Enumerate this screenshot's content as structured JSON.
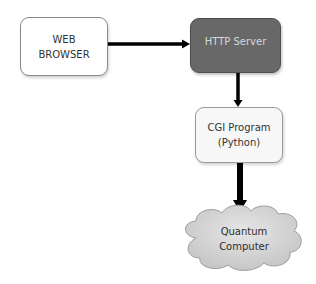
{
  "diagram": {
    "nodes": [
      {
        "id": "web-browser",
        "lines": [
          "WEB",
          "BROWSER"
        ],
        "shape": "rounded-rect",
        "fill": "#ffffff",
        "border": "#8a8a8a",
        "text_color": "#333333"
      },
      {
        "id": "http-server",
        "lines": [
          "HTTP Server"
        ],
        "shape": "rounded-rect",
        "fill": "#686868",
        "border": "#4e4e4e",
        "text_color": "#d8d8d8"
      },
      {
        "id": "cgi-program",
        "lines": [
          "CGI Program",
          "(Python)"
        ],
        "shape": "rounded-rect",
        "fill": "#f7f7f7",
        "border": "#9a9a9a",
        "text_color": "#333333"
      },
      {
        "id": "quantum-computer",
        "lines": [
          "Quantum",
          "Computer"
        ],
        "shape": "cloud",
        "fill": "#d4d4d4",
        "border": "#9c9c9c",
        "text_color": "#2e2e2e"
      }
    ],
    "edges": [
      {
        "from": "web-browser",
        "to": "http-server",
        "direction": "right",
        "color": "#000000"
      },
      {
        "from": "http-server",
        "to": "cgi-program",
        "direction": "down",
        "color": "#000000"
      },
      {
        "from": "cgi-program",
        "to": "quantum-computer",
        "direction": "down",
        "color": "#000000"
      }
    ]
  }
}
